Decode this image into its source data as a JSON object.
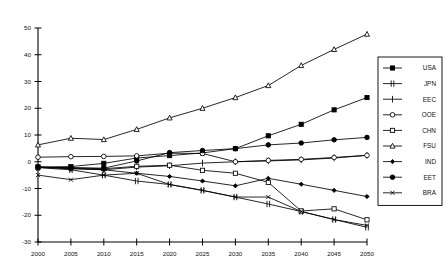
{
  "chart_data": {
    "type": "line",
    "title": "",
    "xlabel": "",
    "ylabel": "",
    "xlim": [
      2000,
      2050
    ],
    "ylim": [
      -30,
      50
    ],
    "grid": false,
    "legend_position": "right",
    "x": [
      2000,
      2005,
      2010,
      2015,
      2020,
      2025,
      2030,
      2035,
      2040,
      2045,
      2050
    ],
    "xtick_labels": [
      "2000",
      "2005",
      "2010",
      "2015",
      "2020",
      "2025",
      "2030",
      "2035",
      "2040",
      "2045",
      "2050"
    ],
    "ytick_labels": [
      "50",
      "40",
      "30",
      "20",
      "10",
      "0",
      "-10",
      "-20",
      "-30"
    ],
    "yticks": [
      50,
      40,
      30,
      20,
      10,
      0,
      -10,
      -20,
      -30
    ],
    "series": [
      {
        "name": "USA",
        "marker": "filled-square",
        "values": [
          -2.0,
          -1.8,
          -0.6,
          1.4,
          2.3,
          3.3,
          4.9,
          9.7,
          14.0,
          19.4,
          24.0
        ]
      },
      {
        "name": "JPN",
        "marker": "double-bar",
        "values": [
          -2.2,
          -3.0,
          -5.0,
          -7.2,
          -8.5,
          -10.7,
          -13.2,
          -15.8,
          -18.6,
          -21.6,
          -24.5
        ]
      },
      {
        "name": "EEC",
        "marker": "plus",
        "values": [
          -2.1,
          -2.6,
          -3.0,
          -2.0,
          -1.5,
          -0.5,
          0.0,
          0.3,
          0.7,
          1.4,
          2.4
        ]
      },
      {
        "name": "OOE",
        "marker": "open-circle",
        "values": [
          1.7,
          1.9,
          2.0,
          2.2,
          3.2,
          3.1,
          0.0,
          0.5,
          0.9,
          1.6,
          2.4
        ]
      },
      {
        "name": "CHN",
        "marker": "open-square",
        "values": [
          -2.0,
          -2.3,
          -2.6,
          -1.7,
          -1.3,
          -3.2,
          -4.3,
          -7.7,
          -18.4,
          -17.6,
          -21.7
        ]
      },
      {
        "name": "FSU",
        "marker": "open-triangle",
        "values": [
          6.3,
          8.8,
          8.3,
          12.1,
          16.4,
          20.0,
          24.0,
          28.5,
          36.0,
          42.0,
          47.7
        ]
      },
      {
        "name": "IND",
        "marker": "small-diamond",
        "values": [
          -2.0,
          -2.5,
          -3.0,
          -4.3,
          -5.5,
          -7.2,
          -9.0,
          -6.2,
          -8.4,
          -10.7,
          -13.0
        ]
      },
      {
        "name": "EET",
        "marker": "filled-circle",
        "values": [
          -2.0,
          -2.2,
          -2.4,
          0.3,
          3.4,
          4.2,
          4.9,
          6.3,
          7.0,
          8.2,
          9.1
        ]
      },
      {
        "name": "BRA",
        "marker": "x-cross",
        "values": [
          -5.0,
          -6.7,
          -5.0,
          -4.3,
          -8.5,
          -10.7,
          -13.2,
          -13.2,
          -18.6,
          -21.6,
          -23.8
        ]
      }
    ]
  },
  "legend": {
    "entries": [
      "USA",
      "JPN",
      "EEC",
      "OOE",
      "CHN",
      "FSU",
      "IND",
      "EET",
      "BRA"
    ]
  }
}
